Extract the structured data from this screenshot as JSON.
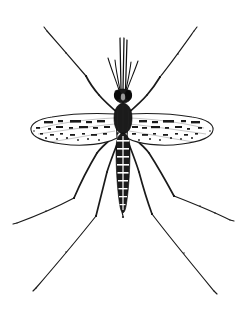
{
  "figure": {
    "view": "dorsal",
    "style": "black-and-white scientific line drawing",
    "background_color": "#ffffff",
    "ink_color": "#141414",
    "width": 238,
    "height": 310,
    "caption": ""
  },
  "anatomy": {
    "head": {
      "name": "head",
      "center_x": 122,
      "center_y": 96,
      "width": 17,
      "height": 14,
      "shading": "dark filled with compound eyes"
    },
    "thorax": {
      "name": "thorax",
      "center_x": 122,
      "center_y": 118,
      "width": 16,
      "height": 28,
      "shading": "dark oval scutum"
    },
    "abdomen": {
      "name": "abdomen",
      "top_y": 134,
      "tip_y": 212,
      "center_x": 122,
      "max_width": 13,
      "segment_count": 8,
      "pattern": "banded segments with pale cross-bands"
    },
    "proboscis": {
      "name": "proboscis",
      "base_x": 122,
      "base_y": 90,
      "tip_y": 38,
      "line_count": 3
    },
    "palps": {
      "name": "maxillary-palps",
      "pair_count": 2,
      "spread_px": 14,
      "tip_y": 52
    }
  },
  "wings": {
    "count": 2,
    "pattern": "mottled dark scale spots along veins",
    "left": {
      "name": "left-wing",
      "root_x": 112,
      "root_y": 120,
      "tip_x": 34,
      "span_px": 78,
      "max_chord": 26
    },
    "right": {
      "name": "right-wing",
      "root_x": 132,
      "root_y": 120,
      "tip_x": 210,
      "span_px": 78,
      "max_chord": 26
    },
    "spot_count": 34
  },
  "legs": {
    "count": 6,
    "pairs": [
      {
        "name": "fore-legs",
        "left_path": "M 120 116 L 100 96 L 86 76 L 46 31",
        "right_path": "M 126 116 L 146 96 L 160 78 L 194 30"
      },
      {
        "name": "mid-legs",
        "left_path": "M 118 134 L 98 150 L 74 198 L 16 223",
        "right_path": "M 128 134 L 148 150 L 174 196 L 231 220"
      },
      {
        "name": "hind-legs",
        "left_path": "M 119 140 L 108 170 L 96 216 L 36 288",
        "right_path": "M 127 140 L 139 170 L 152 214 L 214 291"
      }
    ],
    "joint_marks": "faint tarsal segment ticks along each leg"
  },
  "labels": {
    "title": "",
    "footer": ""
  }
}
